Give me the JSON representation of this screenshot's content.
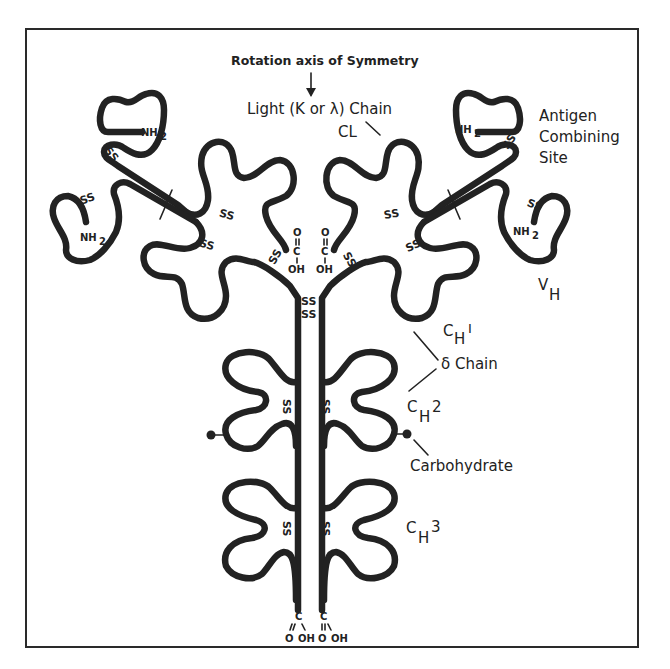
{
  "title": "Rotation axis of Symmetry",
  "labels": {
    "light_chain": "Light (K or λ) Chain",
    "cl": "CL",
    "antigen_site_1": "Antigen",
    "antigen_site_2": "Combining",
    "antigen_site_3": "Site",
    "vh_main": "V",
    "vh_sub": "H",
    "ch1_main": "C",
    "ch1_sub": "H",
    "ch1_sup": "I",
    "gamma_chain": "δ Chain",
    "ch2_main": "C",
    "ch2_sub": "H",
    "ch2_sup": "2",
    "carbohydrate": "Carbohydrate",
    "ch3_main": "C",
    "ch3_sub": "H",
    "ch3_sup": "3"
  },
  "chem": {
    "nh2": "NH",
    "nh2_sub": "2",
    "ss": "SS",
    "o": "O",
    "c": "C",
    "oh": "OH"
  },
  "colors": {
    "ink": "#222222",
    "background": "#ffffff"
  }
}
